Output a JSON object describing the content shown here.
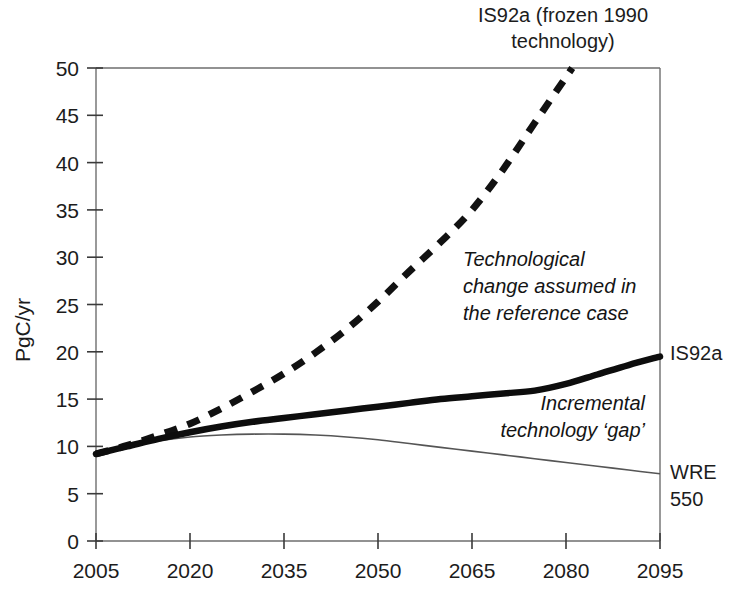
{
  "chart_data": {
    "type": "line",
    "title": "IS92a (frozen 1990 technology)",
    "title_line1": "IS92a (frozen 1990",
    "title_line2": "technology)",
    "xlabel": "",
    "ylabel": "PgC/yr",
    "xlim": [
      2005,
      2095
    ],
    "ylim": [
      0,
      50
    ],
    "grid": false,
    "legend_position": "right-inline",
    "xticks": [
      "2005",
      "2020",
      "2035",
      "2050",
      "2065",
      "2080",
      "2095"
    ],
    "xtick_values": [
      2005,
      2020,
      2035,
      2050,
      2065,
      2080,
      2095
    ],
    "yticks": [
      "0",
      "5",
      "10",
      "15",
      "20",
      "25",
      "30",
      "35",
      "40",
      "45",
      "50"
    ],
    "ytick_values": [
      0,
      5,
      10,
      15,
      20,
      25,
      30,
      35,
      40,
      45,
      50
    ],
    "series": [
      {
        "name": "IS92a (frozen 1990 technology)",
        "style": "dashed",
        "color": "#111111",
        "x": [
          2005,
          2010,
          2015,
          2020,
          2025,
          2030,
          2035,
          2040,
          2045,
          2050,
          2055,
          2060,
          2065,
          2070,
          2075,
          2081
        ],
        "values": [
          9.2,
          10.1,
          11.2,
          12.4,
          14.0,
          15.8,
          17.7,
          19.9,
          22.4,
          25.3,
          28.5,
          31.6,
          35.0,
          39.3,
          44.2,
          50.0
        ]
      },
      {
        "name": "IS92a",
        "style": "thick-solid",
        "color": "#0d0d0d",
        "x": [
          2005,
          2010,
          2015,
          2020,
          2025,
          2030,
          2035,
          2040,
          2045,
          2050,
          2055,
          2060,
          2065,
          2070,
          2075,
          2080,
          2085,
          2090,
          2095
        ],
        "values": [
          9.2,
          10.0,
          10.8,
          11.5,
          12.1,
          12.6,
          13.0,
          13.4,
          13.8,
          14.2,
          14.6,
          15.0,
          15.3,
          15.6,
          15.9,
          16.6,
          17.6,
          18.6,
          19.5
        ]
      },
      {
        "name": "WRE 550",
        "style": "thin-solid",
        "color": "#555555",
        "x": [
          2005,
          2010,
          2015,
          2020,
          2025,
          2030,
          2035,
          2040,
          2045,
          2050,
          2055,
          2060,
          2065,
          2070,
          2075,
          2080,
          2085,
          2090,
          2095
        ],
        "values": [
          9.2,
          10.0,
          10.6,
          11.0,
          11.2,
          11.3,
          11.3,
          11.2,
          11.0,
          10.7,
          10.3,
          9.9,
          9.5,
          9.1,
          8.7,
          8.3,
          7.9,
          7.5,
          7.1
        ]
      }
    ],
    "series_labels": [
      {
        "text": "IS92a",
        "anchor_year": 2095,
        "anchor_value": 19.5
      },
      {
        "text": "WRE",
        "anchor_year": 2095,
        "anchor_value": 7.1
      },
      {
        "text": "550",
        "anchor_year": 2095,
        "anchor_value": 5.0
      }
    ],
    "annotations": [
      {
        "id": "reference-case",
        "lines": [
          "Technological",
          "change assumed in",
          "the reference case"
        ],
        "style": "italic",
        "align": "left"
      },
      {
        "id": "technology-gap",
        "lines": [
          "Incremental",
          "technology ‘gap’"
        ],
        "style": "italic",
        "align": "right"
      }
    ]
  }
}
